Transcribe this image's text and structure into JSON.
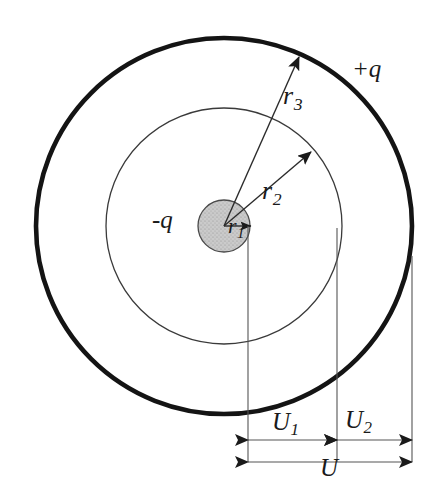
{
  "figure": {
    "type": "physics-diagram",
    "background_color": "#ffffff",
    "stroke_color": "#1a1a1a",
    "inner_sphere_fill": "#cccccc"
  },
  "geometry": {
    "center": {
      "x": 224,
      "y": 226
    },
    "inner_sphere_radius": 26,
    "middle_circle_radius": 118,
    "outer_circle_radius": 188,
    "outer_circle_stroke_width": 4.5,
    "middle_circle_stroke_width": 1.2,
    "inner_circle_stroke_width": 1.2
  },
  "charges": {
    "inner": {
      "label": "-q",
      "x": 152,
      "y": 207
    },
    "outer": {
      "label": "+q",
      "x": 352,
      "y": 56
    }
  },
  "radii": [
    {
      "name": "r1",
      "symbol": "r",
      "subscript": "1",
      "label_x": 228,
      "label_y": 215,
      "arrow_to": {
        "x": 250,
        "y": 226
      }
    },
    {
      "name": "r2",
      "symbol": "r",
      "subscript": "2",
      "label_x": 262,
      "label_y": 178,
      "arrow_to": {
        "x": 311,
        "y": 152
      }
    },
    {
      "name": "r3",
      "symbol": "r",
      "subscript": "3",
      "label_x": 283,
      "label_y": 83,
      "arrow_to": {
        "x": 299,
        "y": 57
      }
    }
  ],
  "dimensions": {
    "vertical_guides": [
      {
        "name": "guide-center",
        "x": 248,
        "y_top": 226,
        "y_bottom": 462
      },
      {
        "name": "guide-middle",
        "x": 337,
        "y_top": 228,
        "y_bottom": 462
      },
      {
        "name": "guide-outer",
        "x": 412,
        "y_top": 256,
        "y_bottom": 462
      }
    ],
    "segments": [
      {
        "name": "U1",
        "symbol": "U",
        "subscript": "1",
        "label_x": 272,
        "label_y": 409,
        "line_y": 440,
        "x_start": 248,
        "x_end": 337
      },
      {
        "name": "U2",
        "symbol": "U",
        "subscript": "2",
        "label_x": 345,
        "label_y": 407,
        "line_y": 440,
        "x_start": 337,
        "x_end": 412
      },
      {
        "name": "U",
        "symbol": "U",
        "subscript": "",
        "label_x": 320,
        "label_y": 455,
        "line_y": 462,
        "x_start": 248,
        "x_end": 412
      }
    ]
  }
}
